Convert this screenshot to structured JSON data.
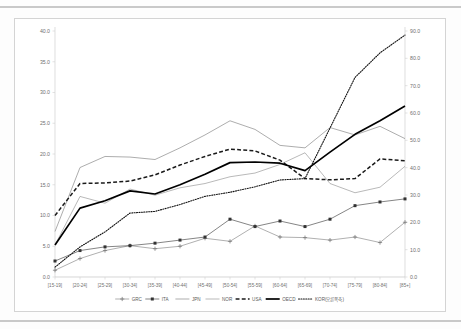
{
  "figure": {
    "frame_border_color": "#d4d4d4",
    "background": "#ffffff",
    "rule_color": "#c9c9c9"
  },
  "chart_data": {
    "type": "line",
    "title": "",
    "subtitle": "",
    "xlabel": "",
    "ylabel": "",
    "y2label": "",
    "grid": false,
    "legend_position": "bottom",
    "categories": [
      "[15-19]",
      "[20-24]",
      "[25-29]",
      "[30-34]",
      "[35-39]",
      "[40-44]",
      "[45-49]",
      "[50-54]",
      "[55-59]",
      "[60-64]",
      "[65-69]",
      "[70-74]",
      "[75-79]",
      "[80-84]",
      "[85+]"
    ],
    "ylim": [
      0.0,
      40.0
    ],
    "yticks": [
      "0.0",
      "5.0",
      "10.0",
      "15.0",
      "20.0",
      "25.0",
      "30.0",
      "35.0",
      "40.0"
    ],
    "ytick_values": [
      0.0,
      5.0,
      10.0,
      15.0,
      20.0,
      25.0,
      30.0,
      35.0,
      40.0
    ],
    "y2lim": [
      0.0,
      90.0
    ],
    "y2ticks": [
      "0.0",
      "10.0",
      "20.0",
      "30.0",
      "40.0",
      "50.0",
      "60.0",
      "70.0",
      "80.0",
      "90.0"
    ],
    "y2tick_values": [
      0.0,
      10.0,
      20.0,
      30.0,
      40.0,
      50.0,
      60.0,
      70.0,
      80.0,
      90.0
    ],
    "series": [
      {
        "name": "GRC",
        "axis": "left",
        "style": "solid-marker",
        "marker": "plus",
        "color": "#7a7a7a",
        "width": 0.6,
        "values": [
          1.1,
          3.0,
          4.3,
          5.1,
          4.6,
          5.0,
          6.3,
          5.8,
          8.3,
          6.5,
          6.4,
          6.0,
          6.5,
          5.6,
          8.9
        ]
      },
      {
        "name": "ITA",
        "axis": "left",
        "style": "solid-marker",
        "marker": "square",
        "color": "#333333",
        "width": 0.6,
        "values": [
          2.6,
          4.3,
          4.9,
          5.1,
          5.5,
          6.0,
          6.5,
          9.4,
          8.2,
          9.1,
          8.2,
          9.4,
          11.6,
          12.2,
          12.7
        ]
      },
      {
        "name": "JPN",
        "axis": "left",
        "style": "solid",
        "color": "#8a8a8a",
        "width": 0.7,
        "values": [
          7.4,
          17.8,
          19.6,
          19.5,
          19.1,
          21.0,
          23.1,
          25.4,
          24.0,
          21.4,
          21.0,
          24.3,
          23.1,
          24.5,
          22.5
        ]
      },
      {
        "name": "NOR",
        "axis": "left",
        "style": "solid",
        "color": "#8a8a8a",
        "width": 0.6,
        "values": [
          5.2,
          13.1,
          12.0,
          14.3,
          13.3,
          14.5,
          15.2,
          16.3,
          16.9,
          18.3,
          20.2,
          15.2,
          13.7,
          14.6,
          18.0
        ]
      },
      {
        "name": "USA",
        "axis": "left",
        "style": "dashed",
        "color": "#1a1a1a",
        "width": 1.5,
        "values": [
          10.0,
          15.2,
          15.3,
          15.6,
          16.6,
          18.2,
          19.6,
          20.8,
          20.5,
          19.0,
          16.0,
          15.8,
          16.0,
          19.2,
          18.9
        ]
      },
      {
        "name": "OECD",
        "axis": "left",
        "style": "solid",
        "color": "#000000",
        "width": 1.7,
        "values": [
          5.2,
          11.2,
          12.4,
          14.0,
          13.5,
          15.0,
          16.7,
          18.6,
          18.7,
          18.5,
          17.3,
          20.3,
          23.2,
          25.4,
          27.8
        ]
      },
      {
        "name": "KOR(오른쪽축)",
        "axis": "right",
        "style": "dotted",
        "color": "#111111",
        "width": 1.1,
        "values": [
          3.6,
          11.0,
          16.5,
          23.4,
          24.0,
          26.5,
          29.5,
          31.0,
          33.0,
          35.5,
          36.0,
          54.5,
          73.0,
          82.0,
          88.5
        ]
      }
    ]
  }
}
